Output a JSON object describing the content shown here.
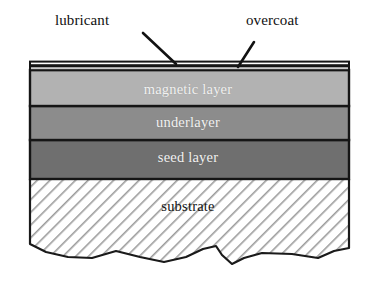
{
  "figure": {
    "background_color": "#ffffff"
  },
  "callouts": [
    {
      "id": "lubricant",
      "label": "lubricant",
      "leader": {
        "x1": 143,
        "y1": 33,
        "x2": 176,
        "y2": 64
      }
    },
    {
      "id": "overcoat",
      "label": "overcoat",
      "leader": {
        "x1": 254,
        "y1": 42,
        "x2": 238,
        "y2": 67
      }
    }
  ],
  "stack": {
    "left": 30,
    "right": 349,
    "layers": [
      {
        "id": "lubricant-film",
        "label": "",
        "fill": "#ffffff",
        "top": 62,
        "bottom": 66,
        "text_color": "",
        "hatched": false
      },
      {
        "id": "overcoat-film",
        "label": "",
        "fill": "#c9c9c9",
        "top": 66,
        "bottom": 70,
        "text_color": "",
        "hatched": false
      },
      {
        "id": "magnetic-layer",
        "label": "magnetic layer",
        "fill": "#b2b2b2",
        "top": 70,
        "bottom": 106,
        "text_color": "#f2f2f2",
        "hatched": false
      },
      {
        "id": "underlayer",
        "label": "underlayer",
        "fill": "#8c8c8c",
        "top": 106,
        "bottom": 140,
        "text_color": "#f2f2f2",
        "hatched": false
      },
      {
        "id": "seed-layer",
        "label": "seed layer",
        "fill": "#6f6f6f",
        "top": 140,
        "bottom": 179,
        "text_color": "#f2f2f2",
        "hatched": false
      },
      {
        "id": "substrate",
        "label": "substrate",
        "fill": "#ffffff",
        "top": 179,
        "bottom": 262,
        "text_color": "#141414",
        "hatched": true
      }
    ],
    "outline_color": "#1a1a1a",
    "hatch_color": "#9a9a9a",
    "broken_edge_points": "30,244 46,252 68,257 92,258 116,251 140,257 164,262 186,257 203,249 216,246 222,255 232,264 244,258 262,253 292,254 318,258 334,251 349,248"
  }
}
